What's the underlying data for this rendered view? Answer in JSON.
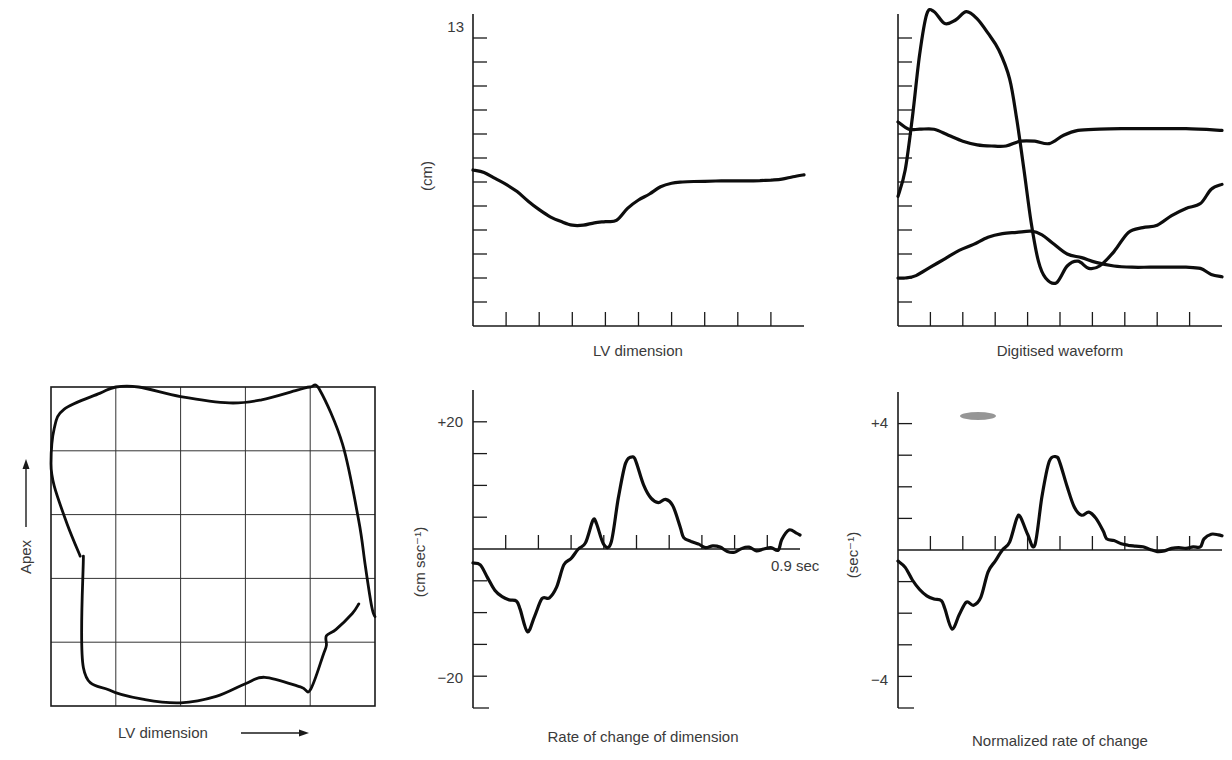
{
  "chart_data": [
    {
      "id": "loop",
      "type": "line",
      "title": "",
      "xlabel": "LV dimension",
      "ylabel": "Apex",
      "grid": true,
      "grid_divisions": 5,
      "xlim": [
        0,
        1
      ],
      "ylim": [
        0,
        1
      ],
      "series": [
        {
          "name": "wall motion loop",
          "points": [
            [
              0.09,
              0.47
            ],
            [
              0.05,
              0.57
            ],
            [
              0.01,
              0.69
            ],
            [
              0.0,
              0.76
            ],
            [
              0.01,
              0.87
            ],
            [
              0.04,
              0.93
            ],
            [
              0.15,
              0.98
            ],
            [
              0.2,
              1.0
            ],
            [
              0.27,
              1.0
            ],
            [
              0.4,
              0.97
            ],
            [
              0.55,
              0.95
            ],
            [
              0.65,
              0.96
            ],
            [
              0.76,
              0.99
            ],
            [
              0.8,
              1.0
            ],
            [
              0.83,
              0.99
            ],
            [
              0.9,
              0.82
            ],
            [
              0.95,
              0.58
            ],
            [
              0.97,
              0.44
            ],
            [
              0.99,
              0.31
            ],
            [
              1.0,
              0.28
            ]
          ]
        },
        {
          "name": "wall motion loop (return)",
          "points": [
            [
              0.1,
              0.47
            ],
            [
              0.1,
              0.12
            ],
            [
              0.18,
              0.05
            ],
            [
              0.29,
              0.02
            ],
            [
              0.4,
              0.01
            ],
            [
              0.51,
              0.03
            ],
            [
              0.6,
              0.07
            ],
            [
              0.66,
              0.09
            ],
            [
              0.77,
              0.06
            ],
            [
              0.8,
              0.05
            ],
            [
              0.84,
              0.16
            ],
            [
              0.85,
              0.19
            ],
            [
              0.85,
              0.22
            ],
            [
              0.88,
              0.24
            ],
            [
              0.93,
              0.29
            ],
            [
              0.95,
              0.32
            ]
          ]
        }
      ]
    },
    {
      "id": "lv-dimension",
      "type": "line",
      "title": "LV dimension",
      "xlabel": "",
      "ylabel": "(cm)",
      "xlim": [
        0,
        0.9
      ],
      "ylim": [
        0,
        13
      ],
      "x_ticks": 9,
      "y_tick_step": 1,
      "y_tick_labels": [
        {
          "value": 13,
          "label": "13"
        }
      ],
      "series": [
        {
          "name": "LV dimension",
          "x": [
            0.0,
            0.03,
            0.06,
            0.09,
            0.12,
            0.15,
            0.18,
            0.21,
            0.24,
            0.27,
            0.3,
            0.33,
            0.36,
            0.39,
            0.42,
            0.45,
            0.48,
            0.51,
            0.54,
            0.57,
            0.6,
            0.63,
            0.66,
            0.69,
            0.72,
            0.75,
            0.78,
            0.81,
            0.84,
            0.87,
            0.9
          ],
          "y": [
            6.5,
            6.4,
            6.15,
            5.9,
            5.6,
            5.2,
            4.85,
            4.55,
            4.35,
            4.2,
            4.2,
            4.3,
            4.35,
            4.4,
            4.9,
            5.25,
            5.5,
            5.8,
            5.95,
            6.0,
            6.02,
            6.03,
            6.04,
            6.05,
            6.05,
            6.05,
            6.06,
            6.08,
            6.12,
            6.22,
            6.3
          ]
        }
      ]
    },
    {
      "id": "digitised-waveform",
      "type": "line",
      "title": "Digitised waveform",
      "xlabel": "",
      "ylabel": "",
      "xlim": [
        0,
        0.9
      ],
      "ylim": [
        0,
        13
      ],
      "x_ticks": 9,
      "y_tick_step": 1,
      "series": [
        {
          "name": "wave A (large)",
          "x": [
            0.0,
            0.02,
            0.04,
            0.06,
            0.08,
            0.1,
            0.13,
            0.16,
            0.19,
            0.22,
            0.25,
            0.28,
            0.31,
            0.33,
            0.35,
            0.37,
            0.39,
            0.41,
            0.44,
            0.47,
            0.5,
            0.53,
            0.56,
            0.6,
            0.64,
            0.68,
            0.72,
            0.76,
            0.8,
            0.84,
            0.87,
            0.9
          ],
          "y": [
            5.4,
            6.5,
            8.7,
            11.3,
            13.0,
            13.1,
            12.6,
            12.75,
            13.1,
            12.8,
            12.2,
            11.5,
            10.3,
            8.6,
            6.5,
            4.3,
            2.7,
            2.0,
            1.8,
            2.5,
            2.7,
            2.4,
            2.5,
            3.1,
            3.9,
            4.1,
            4.2,
            4.6,
            4.9,
            5.1,
            5.7,
            5.9
          ]
        },
        {
          "name": "wave B (upper flat)",
          "x": [
            0.0,
            0.03,
            0.06,
            0.1,
            0.14,
            0.18,
            0.22,
            0.26,
            0.3,
            0.34,
            0.38,
            0.42,
            0.46,
            0.5,
            0.56,
            0.62,
            0.7,
            0.8,
            0.9
          ],
          "y": [
            8.5,
            8.2,
            8.2,
            8.2,
            7.95,
            7.7,
            7.55,
            7.5,
            7.5,
            7.7,
            7.7,
            7.6,
            7.95,
            8.15,
            8.2,
            8.22,
            8.22,
            8.22,
            8.15
          ]
        },
        {
          "name": "wave C (lower)",
          "x": [
            0.0,
            0.02,
            0.05,
            0.09,
            0.13,
            0.17,
            0.21,
            0.25,
            0.29,
            0.33,
            0.37,
            0.4,
            0.43,
            0.47,
            0.51,
            0.55,
            0.6,
            0.65,
            0.7,
            0.75,
            0.8,
            0.84,
            0.87,
            0.9
          ],
          "y": [
            2.0,
            2.0,
            2.1,
            2.45,
            2.8,
            3.15,
            3.4,
            3.7,
            3.85,
            3.9,
            3.95,
            3.8,
            3.45,
            3.0,
            2.85,
            2.65,
            2.5,
            2.45,
            2.45,
            2.45,
            2.45,
            2.4,
            2.15,
            2.05
          ]
        }
      ]
    },
    {
      "id": "rate-of-change",
      "type": "line",
      "title": "Rate of change of dimension",
      "xlabel": "",
      "ylabel": "(cm sec⁻¹)",
      "xlim": [
        0,
        0.9
      ],
      "ylim": [
        -25,
        25
      ],
      "x_ticks": 9,
      "x_end_label": "0.9 sec",
      "y_tick_step": 5,
      "y_tick_labels": [
        {
          "value": 20,
          "label": "+20"
        },
        {
          "value": -20,
          "label": "−20"
        }
      ],
      "series": [
        {
          "name": "dD/dt",
          "x": [
            0.0,
            0.02,
            0.04,
            0.06,
            0.08,
            0.1,
            0.12,
            0.13,
            0.15,
            0.17,
            0.19,
            0.21,
            0.23,
            0.25,
            0.27,
            0.29,
            0.31,
            0.33,
            0.34,
            0.36,
            0.38,
            0.4,
            0.42,
            0.44,
            0.45,
            0.47,
            0.49,
            0.51,
            0.53,
            0.55,
            0.57,
            0.58,
            0.6,
            0.62,
            0.64,
            0.66,
            0.68,
            0.7,
            0.72,
            0.74,
            0.76,
            0.78,
            0.8,
            0.82,
            0.84,
            0.85,
            0.87,
            0.89,
            0.9
          ],
          "y": [
            -2.2,
            -2.5,
            -4.5,
            -6.5,
            -7.5,
            -8.0,
            -8.2,
            -9.5,
            -13.0,
            -10.5,
            -7.8,
            -7.7,
            -6.0,
            -2.5,
            -1.5,
            0.0,
            1.0,
            4.5,
            4.0,
            0.7,
            1.0,
            8.0,
            13.5,
            14.5,
            13.5,
            10.0,
            8.0,
            7.3,
            7.8,
            6.8,
            3.5,
            1.8,
            1.2,
            0.8,
            0.2,
            0.5,
            0.3,
            -0.4,
            -0.5,
            0.1,
            0.3,
            -0.3,
            0.0,
            0.2,
            -0.2,
            1.5,
            3.0,
            2.5,
            2.2
          ]
        }
      ]
    },
    {
      "id": "normalized-rate",
      "type": "line",
      "title": "Normalized rate of change",
      "xlabel": "",
      "ylabel": "(sec⁻¹)",
      "xlim": [
        0,
        0.9
      ],
      "ylim": [
        -5,
        5
      ],
      "x_ticks": 9,
      "y_tick_step": 1,
      "y_tick_labels": [
        {
          "value": 4,
          "label": "+4"
        },
        {
          "value": -4,
          "label": "−4"
        }
      ],
      "series": [
        {
          "name": "(dD/dt)/D",
          "x": [
            0.0,
            0.02,
            0.04,
            0.06,
            0.08,
            0.1,
            0.12,
            0.13,
            0.15,
            0.17,
            0.19,
            0.21,
            0.23,
            0.25,
            0.27,
            0.29,
            0.31,
            0.33,
            0.34,
            0.36,
            0.38,
            0.4,
            0.42,
            0.44,
            0.45,
            0.47,
            0.49,
            0.51,
            0.53,
            0.55,
            0.57,
            0.58,
            0.6,
            0.62,
            0.64,
            0.66,
            0.68,
            0.7,
            0.72,
            0.74,
            0.76,
            0.78,
            0.8,
            0.82,
            0.84,
            0.85,
            0.87,
            0.89,
            0.9
          ],
          "y": [
            -0.35,
            -0.55,
            -0.95,
            -1.25,
            -1.45,
            -1.55,
            -1.6,
            -1.85,
            -2.5,
            -2.05,
            -1.65,
            -1.75,
            -1.5,
            -0.7,
            -0.35,
            0.0,
            0.25,
            1.0,
            1.05,
            0.5,
            0.15,
            1.7,
            2.8,
            2.95,
            2.75,
            2.0,
            1.35,
            1.1,
            1.2,
            1.0,
            0.6,
            0.35,
            0.3,
            0.2,
            0.15,
            0.12,
            0.1,
            0.02,
            -0.05,
            -0.03,
            0.05,
            0.08,
            0.05,
            0.1,
            0.1,
            0.35,
            0.5,
            0.48,
            0.45
          ]
        }
      ]
    }
  ],
  "labels": {
    "loop_xlabel": "LV dimension",
    "loop_ylabel": "Apex",
    "p1_title": "LV dimension",
    "p1_ylabel": "(cm)",
    "p1_ytick_top": "13",
    "p2_title": "Digitised waveform",
    "p3_title": "Rate of change of dimension",
    "p3_ylabel": "(cm sec⁻¹)",
    "p3_ytick_top": "+20",
    "p3_ytick_bottom": "−20",
    "p3_xend": "0.9 sec",
    "p4_title": "Normalized rate of change",
    "p4_ylabel": "(sec⁻¹)",
    "p4_ytick_top": "+4",
    "p4_ytick_bottom": "−4"
  }
}
